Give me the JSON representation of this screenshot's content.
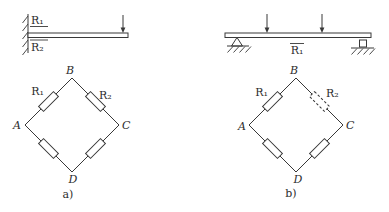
{
  "figure": {
    "background_color": "#ffffff",
    "ink_color": "#383838",
    "panel_a": {
      "caption": "a)",
      "beam": {
        "type": "cantilever-fixed-left",
        "load_count": 1,
        "gauge_top_label": "R₁",
        "gauge_top_notation": "underline",
        "gauge_bottom_label": "R₂",
        "gauge_bottom_notation": "overline"
      },
      "bridge": {
        "node_top": "B",
        "node_left": "A",
        "node_right": "C",
        "node_bottom": "D",
        "arm_upper_left_label": "R₁",
        "arm_upper_left_style": "solid",
        "arm_upper_right_label": "R₂",
        "arm_upper_right_style": "solid",
        "arm_lower_left_label": "",
        "arm_lower_right_label": ""
      }
    },
    "panel_b": {
      "caption": "b)",
      "beam": {
        "type": "simply-supported",
        "load_count": 2,
        "gauge_label": "R₁",
        "gauge_notation": "overline"
      },
      "bridge": {
        "node_top": "B",
        "node_left": "A",
        "node_right": "C",
        "node_bottom": "D",
        "arm_upper_left_label": "R₁",
        "arm_upper_left_style": "solid",
        "arm_upper_right_label": "R₂",
        "arm_upper_right_style": "dashed",
        "arm_lower_left_label": "",
        "arm_lower_right_label": ""
      }
    }
  }
}
